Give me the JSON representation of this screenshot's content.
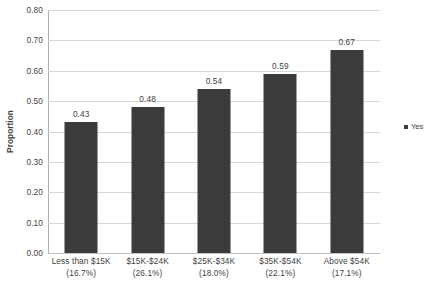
{
  "chart_data": {
    "type": "bar",
    "title": "",
    "xlabel": "",
    "ylabel": "Proportion",
    "ylim": [
      0.0,
      0.8
    ],
    "ytick_step": 0.1,
    "grid": true,
    "legend_position": "right",
    "series_name": "Yes",
    "bar_color": "#3b3b3b",
    "gridline_color": "#d6d6d6",
    "categories": [
      "Less than $15K",
      "$15K-$24K",
      "$25K-$34K",
      "$35K-$54K",
      "Above $54K"
    ],
    "category_shares": [
      "(16.7%)",
      "(26.1%)",
      "(18.0%)",
      "(22.1%)",
      "(17.1%)"
    ],
    "values": [
      0.43,
      0.48,
      0.54,
      0.59,
      0.67
    ],
    "value_labels": [
      "0.43",
      "0.48",
      "0.54",
      "0.59",
      "0.67"
    ],
    "ytick_labels": [
      "0.80",
      "0.70",
      "0.60",
      "0.50",
      "0.40",
      "0.30",
      "0.20",
      "0.10",
      "0.00"
    ],
    "ytick_values": [
      0.8,
      0.7,
      0.6,
      0.5,
      0.4,
      0.3,
      0.2,
      0.1,
      0.0
    ]
  },
  "legend": {
    "items": [
      {
        "label": "Yes",
        "color": "#3b3b3b"
      }
    ]
  }
}
